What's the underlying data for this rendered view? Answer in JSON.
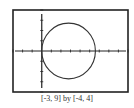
{
  "chart_data": {
    "type": "line",
    "title": "",
    "caption": "[-3, 9] by [-4, 4]",
    "xlabel": "",
    "ylabel": "",
    "xlim": [
      -3,
      9
    ],
    "ylim": [
      -4,
      4
    ],
    "xscale": 1,
    "yscale": 1,
    "grid": false,
    "legend": null,
    "series": [
      {
        "name": "circle",
        "shape": "circle",
        "center": [
          2.8,
          0
        ],
        "radius": 2.8,
        "approx_equation": "(x - 2.8)^2 + y^2 = 2.8^2",
        "x_extent": [
          0,
          5.6
        ],
        "y_extent": [
          -2.7,
          2.8
        ]
      }
    ]
  },
  "colors": {
    "frame": "#222222",
    "axes": "#222222",
    "curve": "#333333",
    "background": "#ffffff"
  }
}
